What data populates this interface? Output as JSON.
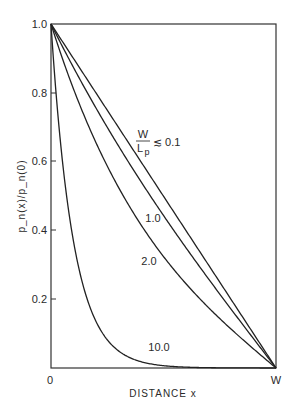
{
  "chart_data": {
    "type": "line",
    "title": "",
    "xlabel": "DISTANCE x",
    "ylabel": "p_n(x)/p_n(0)",
    "xlim": [
      0,
      1
    ],
    "ylim": [
      0,
      1.0
    ],
    "x_tick_labels": [
      "0",
      "W"
    ],
    "y_ticks": [
      0.2,
      0.4,
      0.6,
      0.8,
      1.0
    ],
    "y_tick_labels": [
      "0.2",
      "0.4",
      "0.6",
      "0.8",
      "1.0"
    ],
    "grid": false,
    "legend": "inline curve labels",
    "parameter_label": "W/Lp",
    "x": [
      0,
      0.1,
      0.2,
      0.3,
      0.4,
      0.5,
      0.6,
      0.7,
      0.8,
      0.9,
      1.0
    ],
    "series": [
      {
        "name": "W/Lp ≲ 0.1",
        "label": "W/Lp ≲ 0.1",
        "param": 0.1,
        "values": [
          1.0,
          0.9,
          0.8,
          0.7,
          0.6,
          0.5,
          0.4,
          0.3,
          0.2,
          0.1,
          0.0
        ]
      },
      {
        "name": "1.0",
        "label": "1.0",
        "param": 1.0,
        "values": [
          1.0,
          0.87,
          0.75,
          0.64,
          0.53,
          0.44,
          0.35,
          0.26,
          0.17,
          0.09,
          0.0
        ]
      },
      {
        "name": "2.0",
        "label": "2.0",
        "param": 2.0,
        "values": [
          1.0,
          0.77,
          0.59,
          0.45,
          0.33,
          0.24,
          0.16,
          0.11,
          0.06,
          0.03,
          0.0
        ]
      },
      {
        "name": "10.0",
        "label": "10.0",
        "param": 10.0,
        "values": [
          1.0,
          0.37,
          0.14,
          0.05,
          0.02,
          0.01,
          0.0,
          0.0,
          0.0,
          0.0,
          0.0
        ]
      }
    ]
  },
  "labels": {
    "y_axis": "p_n(x)/p_n(0)",
    "x_axis": "DISTANCE  x",
    "origin": "0",
    "x_end": "W",
    "param_num": "W",
    "param_den": "L",
    "param_den_sub": "p",
    "param_rel": "≲ 0.1",
    "curve_1": "1.0",
    "curve_2": "2.0",
    "curve_10": "10.0",
    "y_ticks": [
      "1.0",
      "0.8",
      "0.6",
      "0.4",
      "0.2"
    ]
  }
}
